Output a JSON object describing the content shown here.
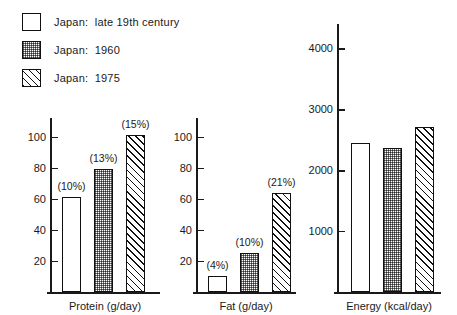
{
  "legend": {
    "items": [
      {
        "label": "Japan:  late 19th century",
        "pattern": "plain"
      },
      {
        "label": "Japan:  1960",
        "pattern": "dot"
      },
      {
        "label": "Japan:  1975",
        "pattern": "hatch"
      }
    ]
  },
  "chart_data": {
    "type": "bar",
    "title": "",
    "series_names": [
      "Japan: late 19th century",
      "Japan: 1960",
      "Japan: 1975"
    ],
    "legend_position": "top-left",
    "grid": false,
    "panels": [
      {
        "xlabel": "Protein (g/day)",
        "ylabel": "",
        "ylim": [
          0,
          112
        ],
        "yticks": [
          20,
          40,
          60,
          80,
          100
        ],
        "ytick_labels": [
          "20",
          "40",
          "60",
          "80",
          "100"
        ],
        "categories": [
          "Japan: late 19th century",
          "Japan: 1960",
          "Japan: 1975"
        ],
        "values": [
          61,
          79,
          101
        ],
        "annotations": [
          "(10%)",
          "(13%)",
          "(15%)"
        ],
        "patterns": [
          "plain",
          "dot",
          "hatch"
        ]
      },
      {
        "xlabel": "Fat (g/day)",
        "ylabel": "",
        "ylim": [
          0,
          112
        ],
        "yticks": [
          20,
          40,
          60,
          80,
          100
        ],
        "ytick_labels": [
          "20",
          "40",
          "60",
          "80",
          "100"
        ],
        "categories": [
          "Japan: late 19th century",
          "Japan: 1960",
          "Japan: 1975"
        ],
        "values": [
          10,
          25,
          64
        ],
        "annotations": [
          "(4%)",
          "(10%)",
          "(21%)"
        ],
        "patterns": [
          "plain",
          "dot",
          "hatch"
        ]
      },
      {
        "xlabel": "Energy (kcal/day)",
        "ylabel": "",
        "ylim": [
          0,
          4400
        ],
        "yticks": [
          1000,
          2000,
          3000,
          4000
        ],
        "ytick_labels": [
          "1000",
          "2000",
          "3000",
          "4000"
        ],
        "categories": [
          "Japan: late 19th century",
          "Japan: 1960",
          "Japan: 1975"
        ],
        "values": [
          2440,
          2370,
          2710
        ],
        "annotations": [
          "",
          "",
          ""
        ],
        "patterns": [
          "plain",
          "dot",
          "hatch"
        ]
      }
    ]
  }
}
